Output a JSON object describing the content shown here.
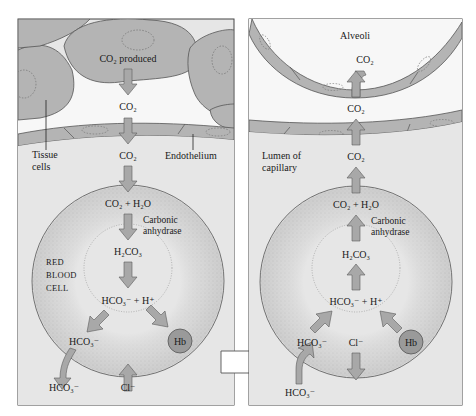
{
  "colors": {
    "panel_bg": "#e6e6e6",
    "cell_fill": "#b4b4b4",
    "cell_stroke": "#555555",
    "rbc_fill": "#dcdcdc",
    "rbc_stipple": "#9a9a9a",
    "arrow_fill": "#a8a8a8",
    "arrow_stroke": "#5a5a5a",
    "hb_fill": "#9a9a9a",
    "alveoli_bg": "#f4f4f4",
    "transition_arrow": "#ffffff"
  },
  "left_panel": {
    "name": "tissue",
    "labels": {
      "co2_produced": "CO₂ produced",
      "co2_interstitial": "CO₂",
      "co2_lumen": "CO₂",
      "tissue_cells": "Tissue",
      "tissue_cells_2": "cells",
      "endothelium": "Endothelium",
      "reaction_1": "CO₂ + H₂O",
      "enzyme_1": "Carbonic",
      "enzyme_2": "anhydrase",
      "carbonic_acid": "H₂CO₃",
      "dissociation": "HCO₃⁻ + H⁺",
      "rbc_1": "Red",
      "rbc_2": "Blood",
      "rbc_3": "Cell",
      "bicarb_inside": "HCO₃⁻",
      "bicarb_outside": "HCO₃⁻",
      "chloride": "Cl⁻",
      "hemoglobin": "Hb"
    }
  },
  "right_panel": {
    "name": "lungs",
    "labels": {
      "alveoli": "Alveoli",
      "co2_alveoli": "CO₂",
      "co2_interstitial": "CO₂",
      "co2_lumen": "CO₂",
      "lumen_1": "Lumen of",
      "lumen_2": "capillary",
      "reaction_1": "CO₂ + H₂O",
      "enzyme_1": "Carbonic",
      "enzyme_2": "anhydrase",
      "carbonic_acid": "H₂CO₃",
      "dissociation": "HCO₃⁻ + H⁺",
      "bicarb_inside": "HCO₃⁻",
      "bicarb_outside": "HCO₃⁻",
      "chloride": "Cl⁻",
      "hemoglobin": "Hb"
    }
  }
}
